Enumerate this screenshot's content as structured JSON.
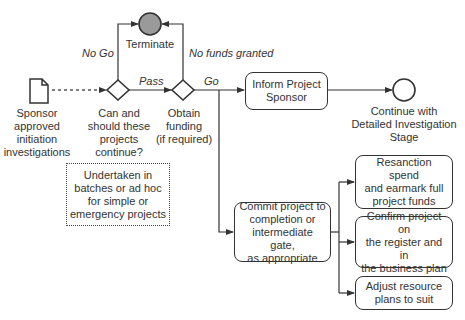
{
  "diagram": {
    "type": "process-flow",
    "nodes": {
      "start_doc": {
        "label": "Sponsor\napproved\ninitiation\ninvestigations"
      },
      "decision_continue": {
        "label": "Can and\nshould these\nprojects\ncontinue?"
      },
      "decision_funding": {
        "label": "Obtain\nfunding\n(if required)"
      },
      "terminate": {
        "label": "Terminate"
      },
      "inform_sponsor": {
        "label": "Inform Project\nSponsor"
      },
      "end_continue": {
        "label": "Continue with\nDetailed Investigation\nStage"
      },
      "note": {
        "label": "Undertaken in\nbatches or ad hoc\nfor simple or\nemergency projects"
      },
      "commit": {
        "label": "Commit project to\ncompletion or\nintermediate gate,\nas appropriate"
      },
      "resanction": {
        "label": "Resanction spend\nand earmark full\nproject funds"
      },
      "confirm": {
        "label": "Confirm project on\nthe register and in\nthe business plan"
      },
      "adjust": {
        "label": "Adjust resource\nplans to suit"
      }
    },
    "edges": {
      "no_go": "No Go",
      "pass": "Pass",
      "no_funds": "No funds granted",
      "go": "Go"
    },
    "colors": {
      "line": "#333333",
      "terminate_fill": "#9a9a9a"
    }
  }
}
